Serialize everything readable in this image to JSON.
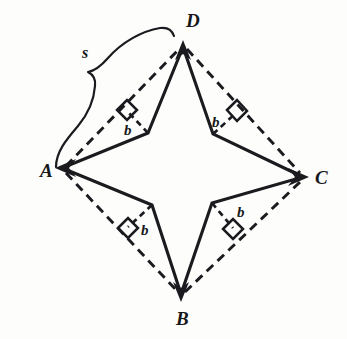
{
  "figure": {
    "background_color": "#fdfdfc",
    "ink_color": "#1b1b1f",
    "width": 347,
    "height": 339,
    "vertex_labels": [
      {
        "name": "D",
        "text": "D",
        "x": 186,
        "y": 27
      },
      {
        "name": "A",
        "text": "A",
        "x": 40,
        "y": 177
      },
      {
        "name": "C",
        "text": "C",
        "x": 315,
        "y": 184
      },
      {
        "name": "B",
        "text": "B",
        "x": 176,
        "y": 325
      }
    ],
    "segment_labels": [
      {
        "name": "b-upper-left",
        "text": "b",
        "x": 124,
        "y": 135
      },
      {
        "name": "b-upper-right",
        "text": "b",
        "x": 212,
        "y": 127
      },
      {
        "name": "b-lower-left",
        "text": "b",
        "x": 141,
        "y": 235
      },
      {
        "name": "b-lower-right",
        "text": "b",
        "x": 237,
        "y": 217
      }
    ],
    "span_label": {
      "name": "s",
      "text": "s",
      "x": 82,
      "y": 58
    },
    "outer_vertices": {
      "D": {
        "x": 183,
        "y": 45
      },
      "A": {
        "x": 62,
        "y": 168
      },
      "C": {
        "x": 303,
        "y": 177
      },
      "B": {
        "x": 181,
        "y": 296
      }
    },
    "inner_vertices": {
      "upper_left": {
        "x": 148,
        "y": 133
      },
      "upper_right": {
        "x": 213,
        "y": 134
      },
      "lower_left": {
        "x": 152,
        "y": 205
      },
      "lower_right": {
        "x": 212,
        "y": 203
      }
    },
    "dashed_sides": [
      "A-D",
      "D-C",
      "A-B",
      "B-C"
    ],
    "right_angle_markers": 4,
    "perpendicular_count": 4,
    "arrowheads_at": [
      "A",
      "B",
      "C",
      "D"
    ]
  }
}
